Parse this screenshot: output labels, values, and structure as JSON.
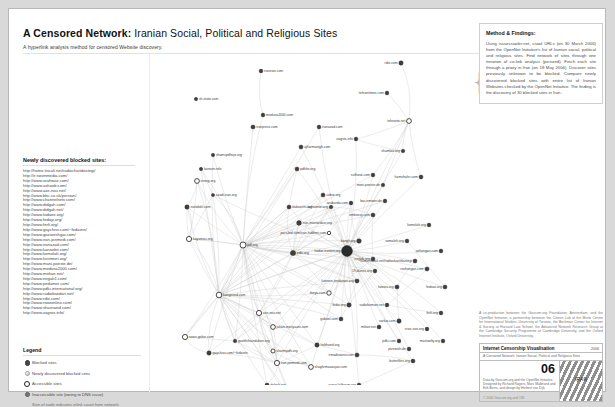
{
  "header": {
    "title_bold": "A Censored Network:",
    "title_rest": " Iranian Social, Political and Religious Sites",
    "subtitle": "A hyperlink analysis method for censored Website discovery."
  },
  "blocked_panel": {
    "heading": "Newly discovered blocked sites:",
    "urls": [
      "http://home.tiscali.net/radiochartdastegi/",
      "http://ir.novinmedia.com/",
      "http://www.arahwaz.com/",
      "http://www.ashoob.com/",
      "http://www.axe-nou.net/",
      "http://www.bbc.co.uk/persian/",
      "http://www.channelnetv.com/",
      "http://www.didgah.com/",
      "http://www.didgah.net/",
      "http://www.fadaee.org/",
      "http://www.fedayi.org/",
      "http://www.ferfi.org/",
      "http://www.gaychiss.com/~fedaiein/",
      "http://www.gozareshgar.com/",
      "http://www.iran-jonmedi.com/",
      "http://www.iranazad.com/",
      "http://www.kanoebit.com/",
      "http://www.komolah.org/",
      "http://www.kvrimnet.org/",
      "http://www.mani-poeste.de/",
      "http://www.medusa2000.com/",
      "http://www.mohan.net/",
      "http://www.negah1.com/",
      "http://www.pedamet.com/",
      "http://www.pdki-international.org/",
      "http://www.radiobandari.net/",
      "http://www.rdio.com/",
      "http://www.roozonline.com/",
      "http://www.sharivand.com/",
      "http://www.zagros.info/"
    ]
  },
  "legend": {
    "heading": "Legend",
    "items": [
      {
        "symbol": "blocked-site-dot",
        "label": "Blocked sites"
      },
      {
        "symbol": "newly-discovered-dot",
        "label": "Newly discovered blocked sites"
      },
      {
        "symbol": "accessible-site-dot",
        "label": "Accessible sites"
      },
      {
        "symbol": "inaccessible-site-dot",
        "label": "Inaccessible site (owing to DNS issue)"
      }
    ],
    "note": "Size of node indicates inlink count from network."
  },
  "method": {
    "heading": "Method & Findings:",
    "body": "Using issuecrawler.net, crawl URLs (on 30 March 2006) from the OpenNet Initiative's list of Iranian social, political and religious sites. Find network of sites through one iteration of co-link analysis (pictured). Fetch each site through a proxy in Iran (on 18 May 2006). Discover sites previously unknown to be blocked. Compare newly discovered blocked sites with entire list of Iranian Websites checked by the OpenNet Initiative. The finding is the discovery of 30 blocked sites in Iran."
  },
  "credit": "A co-production between the Govcom.org Foundation, Amsterdam, and the OpenNet Initiative, a partnership between the Citizen Lab at the Munk Centre for International Studies, University of Toronto, the Berkman Center for Internet & Society at Harvard Law School, the Advanced Network Research Group at the Cambridge Security Programme at Cambridge University, and the Oxford Internet Institute, Oxford University.",
  "colophon": {
    "title": "Internet Censorship Visualisation",
    "year": "2006",
    "subtitle": "A Censored Network: Iranian Social, Political and Religious Sites",
    "number": "06",
    "note": "Data by Govcom.org and the OpenNet Initiative. Designed by Richard Rogers, Marc Malbrand and Erik Borra, and design by Herbert van Dijk.",
    "copyright": "© 2006 Govcom.org and ONI",
    "flag_label": "IRAN"
  },
  "graph": {
    "nodes": [
      {
        "label": "iranews.com",
        "x": 110,
        "y": 16,
        "r": 1.9,
        "type": "blocked"
      },
      {
        "label": "sh-state.com",
        "x": 45,
        "y": 44,
        "r": 1.7,
        "type": "blocked"
      },
      {
        "label": "rdio.com",
        "x": 250,
        "y": 8,
        "r": 2.2,
        "type": "blocked"
      },
      {
        "label": "medusa2000.com",
        "x": 112,
        "y": 60,
        "r": 1.9,
        "type": "blocked"
      },
      {
        "label": "iranpress.com",
        "x": 102,
        "y": 72,
        "r": 2.1,
        "type": "blocked"
      },
      {
        "label": "iranazad.com",
        "x": 168,
        "y": 72,
        "r": 1.9,
        "type": "blocked"
      },
      {
        "label": "tehrantimes.com",
        "x": 236,
        "y": 38,
        "r": 1.9,
        "type": "blocked"
      },
      {
        "label": "zagros.info",
        "x": 205,
        "y": 84,
        "r": 1.9,
        "type": "blocked"
      },
      {
        "label": "tehranto.net",
        "x": 258,
        "y": 66,
        "r": 2.4,
        "type": "open"
      },
      {
        "label": "ajharmanigh.com",
        "x": 150,
        "y": 92,
        "r": 2.0,
        "type": "blocked"
      },
      {
        "label": "shamloo.org",
        "x": 252,
        "y": 96,
        "r": 1.8,
        "type": "blocked"
      },
      {
        "label": "shamspdhoje.org",
        "x": 62,
        "y": 100,
        "r": 1.7,
        "type": "blocked"
      },
      {
        "label": "kanoon.info",
        "x": 50,
        "y": 114,
        "r": 1.7,
        "type": "blocked"
      },
      {
        "label": "iirnwg.org",
        "x": 46,
        "y": 126,
        "r": 2.4,
        "type": "open"
      },
      {
        "label": "pdkho.org",
        "x": 146,
        "y": 114,
        "r": 2.0,
        "type": "blocked"
      },
      {
        "label": "azadi-iran.org",
        "x": 62,
        "y": 140,
        "r": 1.6,
        "type": "blocked"
      },
      {
        "label": "iranidahl.com",
        "x": 36,
        "y": 152,
        "r": 2.2,
        "type": "blocked"
      },
      {
        "label": "babaeirhi.org",
        "x": 138,
        "y": 152,
        "r": 2.0,
        "type": "blocked"
      },
      {
        "label": "iran-mostardast.org",
        "x": 148,
        "y": 168,
        "r": 2.4,
        "type": "blocked"
      },
      {
        "label": "hayatnou.org",
        "x": 38,
        "y": 184,
        "r": 2.6,
        "type": "open"
      },
      {
        "label": "pdf.org",
        "x": 92,
        "y": 190,
        "r": 3.0,
        "type": "open"
      },
      {
        "label": "pdki.org",
        "x": 142,
        "y": 198,
        "r": 2.6,
        "type": "blocked"
      },
      {
        "label": "kangli.org",
        "x": 208,
        "y": 186,
        "r": 2.3,
        "type": "blocked"
      },
      {
        "label": "vabat.org",
        "x": 172,
        "y": 140,
        "r": 2.0,
        "type": "blocked"
      },
      {
        "label": "achtamibi.org",
        "x": 180,
        "y": 152,
        "r": 1.8,
        "type": "blocked"
      },
      {
        "label": "arabarda.com",
        "x": 200,
        "y": 148,
        "r": 1.9,
        "type": "blocked"
      },
      {
        "label": "bar-emtwer.de",
        "x": 234,
        "y": 146,
        "r": 1.9,
        "type": "blocked"
      },
      {
        "label": "embassy.com",
        "x": 222,
        "y": 160,
        "r": 2.0,
        "type": "blocked"
      },
      {
        "label": "pars-bid.com/iran-hiddeni.com",
        "x": 178,
        "y": 178,
        "r": 1.7,
        "type": "open"
      },
      {
        "label": "hedar-iranien.org",
        "x": 196,
        "y": 196,
        "r": 5.4,
        "type": "hub"
      },
      {
        "label": "negah.org",
        "x": 222,
        "y": 204,
        "r": 2.0,
        "type": "blocked"
      },
      {
        "label": "19-dunes.org",
        "x": 224,
        "y": 216,
        "r": 1.9,
        "type": "blocked"
      },
      {
        "label": "kanoon-tendanan.org",
        "x": 206,
        "y": 226,
        "r": 2.1,
        "type": "blocked"
      },
      {
        "label": "dorya.com",
        "x": 178,
        "y": 238,
        "r": 2.2,
        "type": "open"
      },
      {
        "label": "fedai.org",
        "x": 198,
        "y": 250,
        "r": 2.2,
        "type": "blocked"
      },
      {
        "label": "gobool.com",
        "x": 190,
        "y": 264,
        "r": 2.0,
        "type": "blocked"
      },
      {
        "label": "axe-nou.net",
        "x": 108,
        "y": 258,
        "r": 2.6,
        "type": "open"
      },
      {
        "label": "jahan-moriyaani.com",
        "x": 122,
        "y": 272,
        "r": 2.4,
        "type": "open"
      },
      {
        "label": "kangerind.com",
        "x": 68,
        "y": 240,
        "r": 2.8,
        "type": "open"
      },
      {
        "label": "news.gofan.com",
        "x": 34,
        "y": 282,
        "r": 2.6,
        "type": "open"
      },
      {
        "label": "gaychiss.com/~fedaiein",
        "x": 58,
        "y": 298,
        "r": 2.2,
        "type": "blocked"
      },
      {
        "label": "gozbhifoundation.org",
        "x": 84,
        "y": 286,
        "r": 1.8,
        "type": "blocked"
      },
      {
        "label": "shamspdh.org",
        "x": 122,
        "y": 296,
        "r": 2.0,
        "type": "open"
      },
      {
        "label": "hebhand.org",
        "x": 166,
        "y": 290,
        "r": 2.2,
        "type": "blocked"
      },
      {
        "label": "iran-jonmedi.com",
        "x": 126,
        "y": 308,
        "r": 2.6,
        "type": "open"
      },
      {
        "label": "shaghrmaazajan.com",
        "x": 160,
        "y": 312,
        "r": 2.4,
        "type": "open"
      },
      {
        "label": "irmadistaniv.com",
        "x": 206,
        "y": 300,
        "r": 2.1,
        "type": "blocked"
      },
      {
        "label": "pdki.com",
        "x": 248,
        "y": 286,
        "r": 1.9,
        "type": "blocked"
      },
      {
        "label": "pivewish.de",
        "x": 258,
        "y": 294,
        "r": 1.9,
        "type": "blocked"
      },
      {
        "label": "butterfiles.org",
        "x": 262,
        "y": 306,
        "r": 2.0,
        "type": "blocked"
      },
      {
        "label": "dolgah.net",
        "x": 116,
        "y": 330,
        "r": 2.0,
        "type": "blocked"
      },
      {
        "label": "roozonline.com",
        "x": 142,
        "y": 346,
        "r": 1.9,
        "type": "blocked"
      },
      {
        "label": "ranso.lafforum.org",
        "x": 208,
        "y": 330,
        "r": 1.9,
        "type": "blocked"
      },
      {
        "label": "noydad.com",
        "x": 258,
        "y": 340,
        "r": 1.9,
        "type": "blocked"
      },
      {
        "label": "alefba.com",
        "x": 148,
        "y": 364,
        "r": 1.7,
        "type": "blocked"
      },
      {
        "label": "home.tiscali.net/radiochart/dastegi",
        "x": 264,
        "y": 206,
        "r": 2.0,
        "type": "blocked"
      },
      {
        "label": "somaleh.org",
        "x": 256,
        "y": 186,
        "r": 1.9,
        "type": "blocked"
      },
      {
        "label": "roshangari.com",
        "x": 276,
        "y": 214,
        "r": 2.1,
        "type": "blocked"
      },
      {
        "label": "fatows.org",
        "x": 246,
        "y": 232,
        "r": 2.1,
        "type": "blocked"
      },
      {
        "label": "fedawi.org",
        "x": 294,
        "y": 232,
        "r": 2.0,
        "type": "blocked"
      },
      {
        "label": "radiofarmani.net",
        "x": 236,
        "y": 250,
        "r": 1.9,
        "type": "blocked"
      },
      {
        "label": "sarkar.com",
        "x": 248,
        "y": 266,
        "r": 2.2,
        "type": "blocked"
      },
      {
        "label": "mihan.net",
        "x": 228,
        "y": 272,
        "r": 2.0,
        "type": "blocked"
      },
      {
        "label": "ferfi.org",
        "x": 290,
        "y": 258,
        "r": 1.9,
        "type": "blocked"
      },
      {
        "label": "mani-poeste.de",
        "x": 232,
        "y": 130,
        "r": 1.8,
        "type": "blocked"
      },
      {
        "label": "sufhwat.com",
        "x": 222,
        "y": 120,
        "r": 1.9,
        "type": "blocked"
      },
      {
        "label": "hamshahri.com",
        "x": 270,
        "y": 122,
        "r": 2.0,
        "type": "blocked"
      },
      {
        "label": "komolah.org",
        "x": 278,
        "y": 170,
        "r": 1.9,
        "type": "blocked"
      },
      {
        "label": "oxhangari.com",
        "x": 290,
        "y": 196,
        "r": 1.9,
        "type": "blocked"
      },
      {
        "label": "vroz-iran.org",
        "x": 276,
        "y": 274,
        "r": 1.9,
        "type": "blocked"
      },
      {
        "label": "mastoolty.org",
        "x": 292,
        "y": 286,
        "r": 1.9,
        "type": "blocked"
      }
    ]
  }
}
